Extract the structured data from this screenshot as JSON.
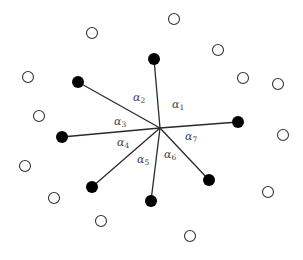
{
  "diagram": {
    "center": {
      "x": 160,
      "y": 128
    },
    "filled_nodes": [
      {
        "id": "n1",
        "x": 154,
        "y": 59
      },
      {
        "id": "n2",
        "x": 78,
        "y": 82
      },
      {
        "id": "n3",
        "x": 62,
        "y": 137
      },
      {
        "id": "n4",
        "x": 92,
        "y": 187
      },
      {
        "id": "n5",
        "x": 151,
        "y": 201
      },
      {
        "id": "n6",
        "x": 209,
        "y": 180
      },
      {
        "id": "n7",
        "x": 238,
        "y": 122
      }
    ],
    "open_nodes": [
      {
        "x": 92,
        "y": 33
      },
      {
        "x": 174,
        "y": 19
      },
      {
        "x": 218,
        "y": 50
      },
      {
        "x": 243,
        "y": 78
      },
      {
        "x": 278,
        "y": 84
      },
      {
        "x": 28,
        "y": 77
      },
      {
        "x": 39,
        "y": 116
      },
      {
        "x": 283,
        "y": 135
      },
      {
        "x": 25,
        "y": 166
      },
      {
        "x": 268,
        "y": 192
      },
      {
        "x": 54,
        "y": 198
      },
      {
        "x": 101,
        "y": 221
      },
      {
        "x": 190,
        "y": 236
      }
    ],
    "angle_labels": [
      {
        "symbol": "α",
        "sub": "1",
        "x": 172,
        "y": 108
      },
      {
        "symbol": "α",
        "sub": "2",
        "x": 133,
        "y": 101
      },
      {
        "symbol": "α",
        "sub": "3",
        "x": 114,
        "y": 125
      },
      {
        "symbol": "α",
        "sub": "4",
        "x": 117,
        "y": 146
      },
      {
        "symbol": "α",
        "sub": "5",
        "x": 137,
        "y": 163
      },
      {
        "symbol": "α",
        "sub": "6",
        "x": 164,
        "y": 158
      },
      {
        "symbol": "α",
        "sub": "7",
        "x": 185,
        "y": 140
      }
    ],
    "colors": {
      "filled": "#000000",
      "open_stroke": "#333333",
      "edge": "#2a2a2a",
      "label": "#444444"
    }
  }
}
